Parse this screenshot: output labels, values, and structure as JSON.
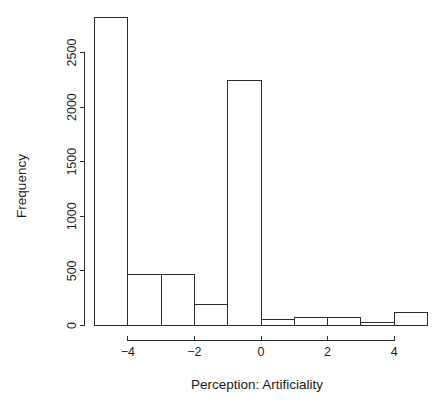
{
  "chart_data": {
    "type": "bar",
    "subtype": "histogram",
    "title": "",
    "xlabel": "Perception: Artificiality",
    "ylabel": "Frequency",
    "grid": false,
    "legend": null,
    "bin_width": 1,
    "bin_edges": [
      -5,
      -4,
      -3,
      -2,
      -1,
      0,
      1,
      2,
      3,
      4,
      5
    ],
    "categories": [
      "[-5,-4)",
      "[-4,-3)",
      "[-3,-2)",
      "[-2,-1)",
      "[-1,0)",
      "[0,1)",
      "[1,2)",
      "[2,3)",
      "[3,4)",
      "[4,5)"
    ],
    "values": [
      2820,
      470,
      470,
      190,
      2240,
      55,
      70,
      70,
      30,
      120
    ],
    "bars": [
      {
        "x0": -5,
        "x1": -4,
        "value": 2820
      },
      {
        "x0": -4,
        "x1": -3,
        "value": 470
      },
      {
        "x0": -3,
        "x1": -2,
        "value": 470
      },
      {
        "x0": -2,
        "x1": -1,
        "value": 190
      },
      {
        "x0": -1,
        "x1": 0,
        "value": 2240
      },
      {
        "x0": 0,
        "x1": 1,
        "value": 55
      },
      {
        "x0": 1,
        "x1": 2,
        "value": 70
      },
      {
        "x0": 2,
        "x1": 3,
        "value": 70
      },
      {
        "x0": 3,
        "x1": 4,
        "value": 30
      },
      {
        "x0": 4,
        "x1": 5,
        "value": 120
      }
    ],
    "xlim": [
      -5,
      5
    ],
    "ylim": [
      0,
      2900
    ],
    "x_ticks": [
      -4,
      -2,
      0,
      2,
      4
    ],
    "x_tick_labels": [
      "−4",
      "−2",
      "0",
      "2",
      "4"
    ],
    "y_ticks": [
      0,
      500,
      1000,
      1500,
      2000,
      2500
    ],
    "y_tick_labels": [
      "0",
      "500",
      "1000",
      "1500",
      "2000",
      "2500"
    ],
    "x_axis_range": [
      -4,
      4
    ],
    "y_axis_range": [
      0,
      2500
    ],
    "colors": {
      "bar_fill": "#ffffff",
      "bar_stroke": "#2b2b2b",
      "axis": "#2b2b2b",
      "text": "#1a1a1a",
      "background": "#ffffff"
    }
  }
}
